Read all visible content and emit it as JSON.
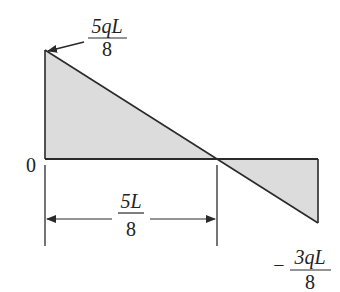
{
  "diagram": {
    "type": "shear-force-diagram",
    "colors": {
      "stroke": "#2a2a2a",
      "fill": "#dcdcdc",
      "text": "#222222"
    },
    "labels": {
      "max_positive": {
        "numerator": "5qL",
        "denominator": "8"
      },
      "max_negative": {
        "sign": "−",
        "numerator": "3qL",
        "denominator": "8"
      },
      "origin": "0",
      "zero_crossing_distance": {
        "numerator": "5L",
        "denominator": "8"
      }
    }
  }
}
